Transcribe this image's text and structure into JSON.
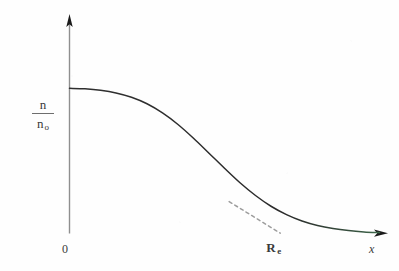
{
  "figure": {
    "background_color": "#fefefe",
    "width": 399,
    "height": 271
  },
  "labels": {
    "y_axis_numerator": "n",
    "y_axis_denominator": "n",
    "y_axis_denominator_subscript": "o",
    "origin": "0",
    "marker_base": "R",
    "marker_subscript": "e",
    "x_axis": "x"
  },
  "colors": {
    "curve": "#2b2b2b",
    "axis_y": "#8c8c8c",
    "axis_x_left": "#b9a3a8",
    "axis_x_mid": "#c9b2b6",
    "axis_x_right": "#6f8f78",
    "arrow_head": "#1a1a1a",
    "tangent_dashed": "#9a9a9a",
    "text": "#3a3a3a"
  },
  "chart_data": {
    "type": "line",
    "title": "",
    "xlabel": "x",
    "ylabel": "n/n_o",
    "grid": false,
    "legend": null,
    "axis_style": "arrow-terminated, no tick marks, no numeric tick labels",
    "xlim": [
      0,
      1.0
    ],
    "ylim": [
      0,
      1.18
    ],
    "x_tick_labels": [
      "0",
      "R_e"
    ],
    "y_tick_labels": [],
    "annotations": [
      {
        "name": "tangent-line",
        "style": "dashed",
        "description": "tangent drawn at the inflection point of the falloff, extrapolated down to the x-axis where it defines R_e",
        "from": [
          0.515,
          0.218
        ],
        "to": [
          0.68,
          0.0
        ]
      },
      {
        "name": "Re-marker",
        "text": "R_e",
        "x": 0.68,
        "y": 0.0,
        "description": "intercept of the tangent with the x-axis"
      }
    ],
    "series": [
      {
        "name": "n/n_o",
        "description": "Fermi-like (Woods-Saxon) density profile: flat plateau near the origin, smooth sigmoid falloff through the inflection, long tail approaching zero",
        "x": [
          0.0,
          0.05,
          0.1,
          0.15,
          0.2,
          0.25,
          0.3,
          0.35,
          0.4,
          0.45,
          0.5,
          0.55,
          0.6,
          0.65,
          0.7,
          0.75,
          0.8,
          0.85,
          0.9,
          0.95,
          1.0
        ],
        "y": [
          1.0,
          0.996,
          0.986,
          0.968,
          0.938,
          0.893,
          0.83,
          0.75,
          0.655,
          0.552,
          0.448,
          0.348,
          0.26,
          0.186,
          0.128,
          0.084,
          0.053,
          0.032,
          0.018,
          0.009,
          0.004
        ]
      }
    ]
  }
}
